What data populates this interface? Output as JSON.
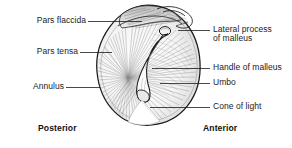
{
  "figure": {
    "style": "pen-and-ink medical line illustration, grayscale hatching",
    "background_color": "#ffffff",
    "ink_color": "#1b1b1b",
    "shading_color": "#8a8a8a",
    "highlight_color": "#ffffff"
  },
  "labels": {
    "pars_flaccida": "Pars flaccida",
    "pars_tensa": "Pars tensa",
    "annulus": "Annulus",
    "lateral_process_line1": "Lateral process",
    "lateral_process_line2": "of malleus",
    "handle_of_malleus": "Handle of malleus",
    "umbo": "Umbo",
    "cone_of_light": "Cone of light"
  },
  "orientation": {
    "posterior": "Posterior",
    "anterior": "Anterior"
  },
  "credit": {
    "text": ""
  },
  "structures": [
    {
      "name": "pars-flaccida",
      "description": "small lax superior region of eardrum above lateral process"
    },
    {
      "name": "pars-tensa",
      "description": "large taut radially-striated region of eardrum"
    },
    {
      "name": "annulus",
      "description": "fibrous rim at periphery of tympanic membrane"
    },
    {
      "name": "lateral-process-of-malleus",
      "description": "bony prominence at superior end of malleus handle"
    },
    {
      "name": "handle-of-malleus",
      "description": "manubrium running inferoposteriorly across the drum"
    },
    {
      "name": "umbo",
      "description": "central depression at inferior tip of malleus handle"
    },
    {
      "name": "cone-of-light",
      "description": "triangular light reflex in anteroinferior quadrant"
    }
  ]
}
